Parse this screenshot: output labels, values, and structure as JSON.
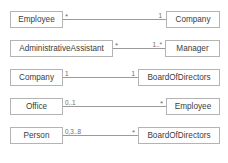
{
  "diagram": {
    "type": "uml-class-association",
    "colors": {
      "box_border": "#b4b4b4",
      "box_fill": "#ffffff",
      "text": "#3c3c3c",
      "line": "#9a9a9a",
      "multiplicity_text": "#6e6e6e",
      "background": "#ffffff"
    },
    "associations": [
      {
        "id": "employee-company",
        "source": {
          "name": "Employee",
          "multiplicity": "*"
        },
        "target": {
          "name": "Company",
          "multiplicity": "1"
        }
      },
      {
        "id": "assistant-manager",
        "source": {
          "name": "AdministrativeAssistant",
          "multiplicity": "*"
        },
        "target": {
          "name": "Manager",
          "multiplicity": "1..*"
        }
      },
      {
        "id": "company-board",
        "source": {
          "name": "Company",
          "multiplicity": "1"
        },
        "target": {
          "name": "BoardOfDirectors",
          "multiplicity": "1"
        }
      },
      {
        "id": "office-employee",
        "source": {
          "name": "Office",
          "multiplicity": "0..1"
        },
        "target": {
          "name": "Employee",
          "multiplicity": "*"
        }
      },
      {
        "id": "person-board",
        "source": {
          "name": "Person",
          "multiplicity": "0,3..8"
        },
        "target": {
          "name": "BoardOfDirectors",
          "multiplicity": "*"
        }
      }
    ]
  }
}
